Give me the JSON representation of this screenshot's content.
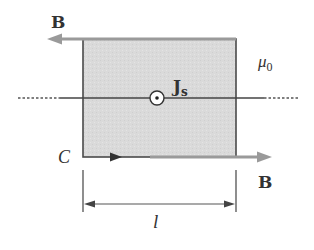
{
  "diagram": {
    "labels": {
      "b_top": "B",
      "b_bottom": "B",
      "current_main": "J",
      "current_sub": "s",
      "medium_mu": "μ",
      "medium_sub": "0",
      "loop": "C",
      "length": "l"
    },
    "colors": {
      "loop_fill": "#d9d9d9",
      "loop_stroke": "#4a4a4a",
      "field_arrow": "#9a9a9a",
      "line": "#444444",
      "text": "#333333"
    },
    "elements": {
      "current_symbol": "circle-dot (out of page)",
      "top_field_direction": "left",
      "bottom_field_direction": "right",
      "loop_direction": "counterclockwise-indicated on bottom edge pointing right"
    }
  }
}
